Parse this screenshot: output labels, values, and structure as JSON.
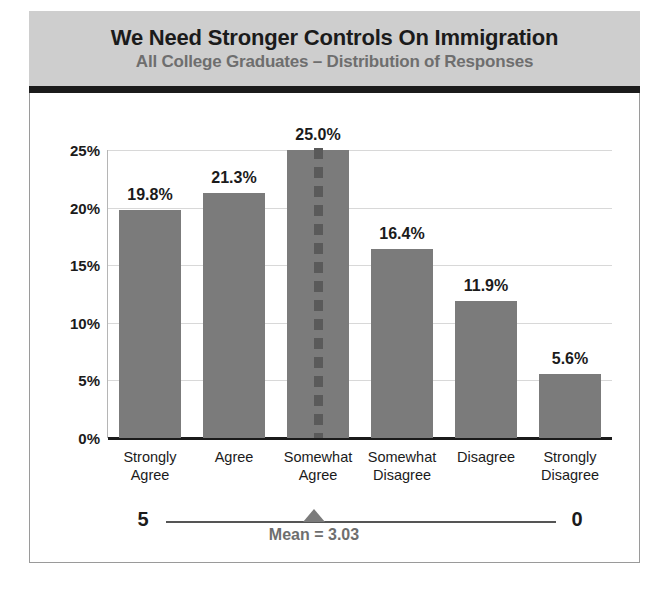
{
  "header": {
    "title": "We Need Stronger Controls On Immigration",
    "subtitle": "All College Graduates – Distribution of Responses"
  },
  "colors": {
    "header_background": "#cecece",
    "header_rule": "#1b1b1b",
    "bar": "#7b7b7b",
    "mean_dash": "#5a5a5a",
    "gridline": "#d8d8d8",
    "title_text": "#1b1b1b",
    "subtitle_text": "#6e6e6e",
    "frame_border": "#9a9a9a"
  },
  "mean_scale": {
    "left_label": "5",
    "right_label": "0",
    "caption": "Mean = 3.03",
    "mean_value": 3.03
  },
  "chart_data": {
    "type": "bar",
    "title": "We Need Stronger Controls On Immigration",
    "subtitle": "All College Graduates – Distribution of Responses",
    "xlabel": "",
    "ylabel": "",
    "ylim": [
      0,
      25
    ],
    "grid": true,
    "legend": "none",
    "orientation": "vertical",
    "ytick_labels": [
      "0%",
      "5%",
      "10%",
      "15%",
      "20%",
      "25%"
    ],
    "ytick_values": [
      0,
      5,
      10,
      15,
      20,
      25
    ],
    "categories": [
      "Strongly\nAgree",
      "Agree",
      "Somewhat\nAgree",
      "Somewhat\nDisagree",
      "Disagree",
      "Strongly\nDisagree"
    ],
    "values": [
      19.8,
      21.3,
      25.0,
      16.4,
      11.9,
      5.6
    ],
    "data_labels": [
      "19.8%",
      "21.3%",
      "25.0%",
      "16.4%",
      "11.9%",
      "5.6%"
    ],
    "annotations": [
      {
        "type": "dashed-vertical-line",
        "category": "Somewhat\nAgree",
        "label": "Mean = 3.03"
      }
    ]
  }
}
